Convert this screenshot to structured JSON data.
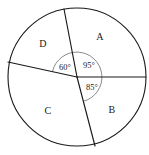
{
  "figure": {
    "type": "circle-sector-diagram",
    "background_color": "#ffffff",
    "stroke_color": "#1a1a1a",
    "arc_color": "#6b6b6b",
    "canvas": {
      "width": 149,
      "height": 155
    },
    "circle": {
      "cx": 77,
      "cy": 77,
      "r": 69
    },
    "inner_arc": {
      "cx": 77,
      "cy": 77,
      "r": 25
    },
    "regions": [
      {
        "id": "A",
        "label": "A",
        "x": 100,
        "y": 38
      },
      {
        "id": "B",
        "label": "B",
        "x": 112,
        "y": 111
      },
      {
        "id": "C",
        "label": "C",
        "x": 48,
        "y": 112
      },
      {
        "id": "D",
        "label": "D",
        "x": 43,
        "y": 45
      }
    ],
    "angles": [
      {
        "id": "angle-95",
        "label": "95°",
        "value": 95,
        "unit": "degrees",
        "x": 89,
        "y": 66
      },
      {
        "id": "angle-60",
        "label": "60°",
        "value": 60,
        "unit": "degrees",
        "x": 65,
        "y": 68
      },
      {
        "id": "angle-85",
        "label": "85°",
        "value": 85,
        "unit": "degrees",
        "x": 92,
        "y": 88
      }
    ],
    "radii": [
      {
        "id": "radius-east",
        "x1": 77,
        "y1": 77,
        "x2": 146,
        "y2": 77
      },
      {
        "id": "radius-north",
        "x1": 77,
        "y1": 77,
        "x2": 64,
        "y2": 9
      },
      {
        "id": "radius-west",
        "x1": 77,
        "y1": 77,
        "x2": 8,
        "y2": 62
      },
      {
        "id": "radius-south",
        "x1": 77,
        "y1": 77,
        "x2": 95,
        "y2": 146
      }
    ]
  }
}
